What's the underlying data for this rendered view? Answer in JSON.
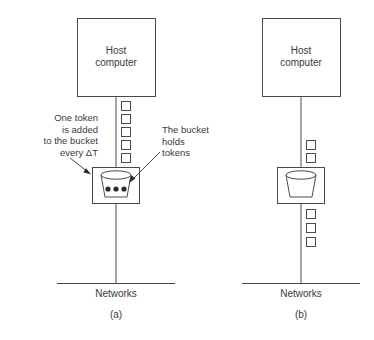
{
  "figure": {
    "stroke_color": "#4a4a4a",
    "text_color": "#3a3a3a",
    "background": "#ffffff"
  },
  "panels": [
    {
      "id": "a",
      "sub_label": "(a)",
      "host_label_line1": "Host",
      "host_label_line2": "computer",
      "network_label": "Networks",
      "tokens_above_bucket": 5,
      "tokens_below_bucket": 0,
      "bucket_token_dots": 3,
      "bucket_state": "full",
      "annotations": [
        {
          "name": "one-token-added",
          "lines": [
            "One token",
            "is added",
            "to the bucket",
            "every ΔT"
          ],
          "align": "right"
        },
        {
          "name": "bucket-holds-tokens",
          "lines": [
            "The bucket",
            "holds",
            "tokens"
          ],
          "align": "left"
        }
      ]
    },
    {
      "id": "b",
      "sub_label": "(b)",
      "host_label_line1": "Host",
      "host_label_line2": "computer",
      "network_label": "Networks",
      "tokens_above_bucket": 2,
      "tokens_below_bucket": 3,
      "bucket_token_dots": 0,
      "bucket_state": "empty",
      "annotations": []
    }
  ]
}
